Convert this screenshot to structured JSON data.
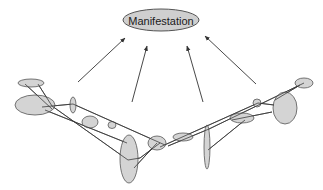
{
  "diagram": {
    "title_node": {
      "label": "Manifestation",
      "cx": 161,
      "cy": 20,
      "rx": 38,
      "ry": 11
    },
    "colors": {
      "fill": "#cfcfcf",
      "stroke": "#555555",
      "line": "#333333"
    },
    "arrows": [
      {
        "x1": 78,
        "y1": 82,
        "x2": 125,
        "y2": 38
      },
      {
        "x1": 132,
        "y1": 102,
        "x2": 147,
        "y2": 46
      },
      {
        "x1": 203,
        "y1": 102,
        "x2": 187,
        "y2": 46
      },
      {
        "x1": 256,
        "y1": 84,
        "x2": 205,
        "y2": 36
      }
    ],
    "ellipses": [
      {
        "id": "e1",
        "cx": 31,
        "cy": 83,
        "rx": 13,
        "ry": 4
      },
      {
        "id": "e2",
        "cx": 35,
        "cy": 105,
        "rx": 20,
        "ry": 10
      },
      {
        "id": "e3",
        "cx": 73,
        "cy": 105,
        "rx": 3,
        "ry": 8
      },
      {
        "id": "e4",
        "cx": 90,
        "cy": 122,
        "rx": 8,
        "ry": 6
      },
      {
        "id": "e5",
        "cx": 112,
        "cy": 125,
        "rx": 4,
        "ry": 3.5
      },
      {
        "id": "e6",
        "cx": 129,
        "cy": 159,
        "rx": 9,
        "ry": 24
      },
      {
        "id": "e7",
        "cx": 157,
        "cy": 143,
        "rx": 9,
        "ry": 7
      },
      {
        "id": "e8",
        "cx": 183,
        "cy": 137,
        "rx": 10,
        "ry": 4
      },
      {
        "id": "e9",
        "cx": 207,
        "cy": 147,
        "rx": 3,
        "ry": 22
      },
      {
        "id": "e10",
        "cx": 242,
        "cy": 118,
        "rx": 12,
        "ry": 5
      },
      {
        "id": "e11",
        "cx": 257,
        "cy": 103,
        "rx": 4,
        "ry": 4
      },
      {
        "id": "e12",
        "cx": 285,
        "cy": 108,
        "rx": 12,
        "ry": 16
      },
      {
        "id": "e13",
        "cx": 304,
        "cy": 83,
        "rx": 9,
        "ry": 5
      }
    ],
    "links": [
      {
        "x1": 25,
        "y1": 84,
        "x2": 52,
        "y2": 109
      },
      {
        "x1": 38,
        "y1": 84,
        "x2": 52,
        "y2": 106
      },
      {
        "x1": 42,
        "y1": 107,
        "x2": 73,
        "y2": 104
      },
      {
        "x1": 52,
        "y1": 106,
        "x2": 128,
        "y2": 160
      },
      {
        "x1": 45,
        "y1": 110,
        "x2": 127,
        "y2": 143
      },
      {
        "x1": 73,
        "y1": 104,
        "x2": 165,
        "y2": 145
      },
      {
        "x1": 128,
        "y1": 160,
        "x2": 140,
        "y2": 158
      },
      {
        "x1": 140,
        "y1": 158,
        "x2": 160,
        "y2": 143
      },
      {
        "x1": 134,
        "y1": 168,
        "x2": 157,
        "y2": 143
      },
      {
        "x1": 168,
        "y1": 146,
        "x2": 209,
        "y2": 129
      },
      {
        "x1": 160,
        "y1": 147,
        "x2": 258,
        "y2": 103
      },
      {
        "x1": 209,
        "y1": 129,
        "x2": 304,
        "y2": 83
      },
      {
        "x1": 208,
        "y1": 150,
        "x2": 245,
        "y2": 120
      },
      {
        "x1": 232,
        "y1": 120,
        "x2": 272,
        "y2": 112
      },
      {
        "x1": 258,
        "y1": 103,
        "x2": 274,
        "y2": 105
      },
      {
        "x1": 275,
        "y1": 100,
        "x2": 300,
        "y2": 85
      }
    ]
  }
}
